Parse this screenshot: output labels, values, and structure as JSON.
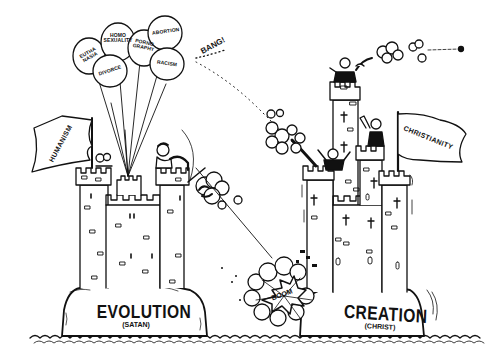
{
  "scene": {
    "description": "Cartoon of two castles at war: Evolution (Satan) vs Creation (Christ)",
    "colors": {
      "ink": "#111111",
      "paper": "#ffffff"
    }
  },
  "left_castle": {
    "rock_label": "EVOLUTION",
    "rock_sublabel": "(SATAN)",
    "flag_label": "HUMANISM",
    "balloons": [
      {
        "label": "EUTHA NASIA"
      },
      {
        "label": "HOMO SEXUALITY"
      },
      {
        "label": "PORNO GRAPHY"
      },
      {
        "label": "ABORTION"
      },
      {
        "label": "DIVORCE"
      },
      {
        "label": "RACISM"
      }
    ]
  },
  "right_castle": {
    "rock_label": "CREATION",
    "rock_sublabel": "(CHRIST)",
    "flag_label": "CHRISTIANITY"
  },
  "sound_effects": {
    "bang": "BANG!",
    "boom": "BOOM"
  }
}
